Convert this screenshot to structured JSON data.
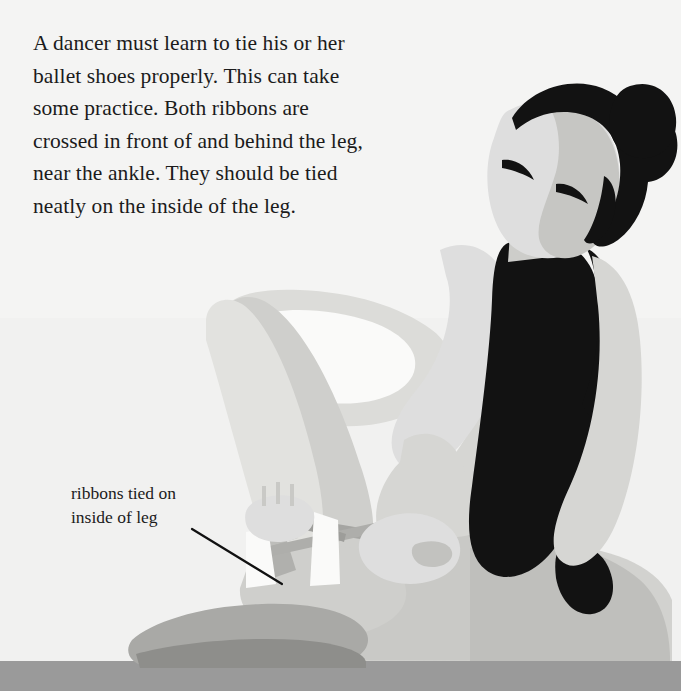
{
  "page": {
    "width": 681,
    "height": 691,
    "background_color": "#f4f4f3",
    "floor_color": "#9a9a9a",
    "floor_top_y": 661
  },
  "body_text": {
    "lines": [
      "A dancer must learn to tie his or her",
      "ballet shoes properly. This can take",
      "some practice. Both ribbons are",
      "crossed in front of and behind the leg,",
      "near the ankle. They should be tied",
      "neatly on the inside of the leg."
    ],
    "full_text": "A dancer must learn to tie his or her ballet shoes properly. This can take some practice. Both ribbons are crossed in front of and behind the leg, near the ankle. They should be tied neatly on the inside of the leg.",
    "color": "#1b1b1b"
  },
  "callout": {
    "lines": [
      "ribbons tied on",
      "inside of leg"
    ],
    "full_text": "ribbons tied on inside of leg",
    "color": "#1b1b1b",
    "leader_line": {
      "x1": 192,
      "y1": 529,
      "x2": 282,
      "y2": 584,
      "color": "#111111",
      "width": 2
    }
  },
  "illustration": {
    "name": "seated-ballet-dancer-tying-shoe-ribbons",
    "description": "Flat vector illustration of a seated dancer in a black leotard tying the ribbons of her ballet shoe around her ankle",
    "palette": {
      "background": "#f4f4f3",
      "background_band": "#efefee",
      "floor": "#9a9a9a",
      "floor_shadow": "#8d8d8d",
      "skin_light": "#e2e2df",
      "skin_mid": "#d2d2cf",
      "skin_shade": "#c4c4c1",
      "skin_deep": "#b6b6b3",
      "highlight": "#fafaf9",
      "leotard": "#121212",
      "hair": "#121212",
      "ribbon": "#aaaaa7",
      "ribbon_dark": "#9d9d9a"
    }
  }
}
